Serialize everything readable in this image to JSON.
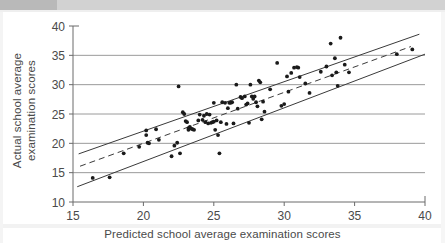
{
  "chart_data": {
    "type": "scatter",
    "title": "",
    "xlabel": "Predicted school average examination scores",
    "ylabel": "Actual school average examination scores",
    "xlim": [
      15,
      40
    ],
    "ylim": [
      10,
      40
    ],
    "xticks": [
      15,
      20,
      25,
      30,
      35,
      40
    ],
    "yticks": [
      10,
      15,
      20,
      25,
      30,
      35,
      40
    ],
    "xtick_labels": [
      "15",
      "20",
      "25",
      "30",
      "35",
      "40"
    ],
    "ytick_labels": [
      "10",
      "15",
      "20",
      "25",
      "30",
      "35",
      "40"
    ],
    "grid": "horizontal",
    "grid_values": [
      15,
      20,
      25,
      30,
      35
    ],
    "legend": "none",
    "point_color": "#1a1a1a",
    "line_color": "#3a3a3a",
    "grid_color": "#9a9a9a",
    "axis_color": "#6a6a6a",
    "points": [
      [
        16.4,
        14.1
      ],
      [
        17.6,
        14.2
      ],
      [
        18.6,
        18.3
      ],
      [
        19.7,
        19.4
      ],
      [
        20.2,
        22.2
      ],
      [
        20.2,
        21.4
      ],
      [
        20.3,
        20.1
      ],
      [
        20.4,
        20.0
      ],
      [
        20.9,
        22.4
      ],
      [
        21.1,
        20.6
      ],
      [
        22.0,
        17.8
      ],
      [
        22.2,
        19.6
      ],
      [
        22.4,
        20.1
      ],
      [
        22.5,
        29.7
      ],
      [
        22.6,
        18.3
      ],
      [
        22.8,
        25.3
      ],
      [
        22.9,
        25.0
      ],
      [
        23.0,
        23.8
      ],
      [
        23.1,
        23.6
      ],
      [
        23.2,
        22.6
      ],
      [
        23.2,
        22.3
      ],
      [
        23.3,
        22.8
      ],
      [
        23.4,
        22.5
      ],
      [
        23.5,
        22.4
      ],
      [
        23.6,
        22.3
      ],
      [
        23.9,
        23.9
      ],
      [
        24.0,
        24.9
      ],
      [
        24.2,
        24.0
      ],
      [
        24.3,
        24.7
      ],
      [
        24.4,
        23.6
      ],
      [
        24.5,
        25.0
      ],
      [
        24.6,
        23.4
      ],
      [
        24.7,
        24.9
      ],
      [
        24.8,
        23.5
      ],
      [
        24.9,
        23.6
      ],
      [
        25.0,
        23.7
      ],
      [
        25.0,
        26.9
      ],
      [
        25.1,
        22.3
      ],
      [
        25.2,
        23.9
      ],
      [
        25.3,
        21.4
      ],
      [
        25.4,
        18.3
      ],
      [
        25.5,
        23.6
      ],
      [
        25.6,
        27.0
      ],
      [
        25.8,
        26.9
      ],
      [
        25.9,
        23.3
      ],
      [
        26.0,
        26.0
      ],
      [
        26.1,
        26.9
      ],
      [
        26.2,
        26.9
      ],
      [
        26.3,
        27.0
      ],
      [
        26.4,
        23.4
      ],
      [
        26.6,
        30.0
      ],
      [
        26.7,
        25.9
      ],
      [
        26.9,
        27.9
      ],
      [
        27.0,
        27.7
      ],
      [
        27.2,
        28.0
      ],
      [
        27.3,
        26.6
      ],
      [
        27.4,
        26.8
      ],
      [
        27.5,
        23.5
      ],
      [
        27.6,
        30.0
      ],
      [
        27.7,
        28.0
      ],
      [
        27.8,
        27.6
      ],
      [
        27.9,
        28.0
      ],
      [
        28.0,
        27.0
      ],
      [
        28.1,
        26.3
      ],
      [
        28.2,
        30.7
      ],
      [
        28.3,
        30.4
      ],
      [
        28.4,
        24.1
      ],
      [
        28.5,
        27.1
      ],
      [
        28.6,
        25.4
      ],
      [
        29.0,
        29.2
      ],
      [
        29.5,
        33.7
      ],
      [
        29.8,
        26.4
      ],
      [
        30.0,
        26.7
      ],
      [
        30.2,
        31.4
      ],
      [
        30.3,
        28.8
      ],
      [
        30.5,
        32.0
      ],
      [
        30.7,
        32.9
      ],
      [
        30.9,
        33.0
      ],
      [
        31.0,
        32.9
      ],
      [
        31.1,
        31.3
      ],
      [
        31.5,
        30.2
      ],
      [
        31.8,
        28.6
      ],
      [
        32.6,
        32.2
      ],
      [
        33.0,
        33.1
      ],
      [
        33.3,
        37.0
      ],
      [
        33.4,
        31.6
      ],
      [
        33.6,
        34.5
      ],
      [
        33.7,
        32.1
      ],
      [
        33.8,
        29.8
      ],
      [
        34.0,
        38.0
      ],
      [
        34.3,
        33.4
      ],
      [
        34.6,
        32.1
      ],
      [
        38.0,
        35.2
      ],
      [
        39.1,
        36.0
      ]
    ],
    "lines": [
      {
        "name": "upper-confidence-band",
        "style": "solid",
        "x": [
          15.4,
          39.6
        ],
        "y": [
          18.2,
          38.6
        ]
      },
      {
        "name": "fitted-regression-line",
        "style": "dashed",
        "x": [
          15.5,
          39.0
        ],
        "y": [
          16.1,
          36.5
        ]
      },
      {
        "name": "lower-confidence-band",
        "style": "solid",
        "x": [
          15.3,
          40.0
        ],
        "y": [
          12.6,
          35.2
        ]
      }
    ]
  }
}
